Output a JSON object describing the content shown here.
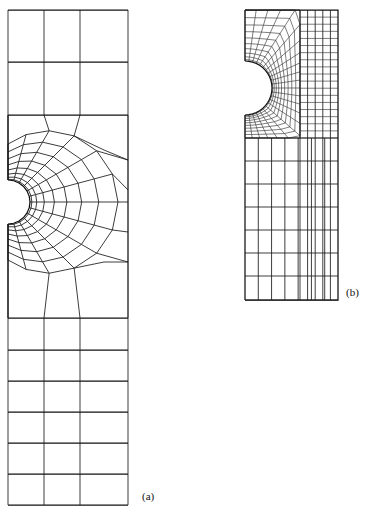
{
  "figure": {
    "type": "finite-element-mesh-comparison",
    "background_color": "#ffffff",
    "line_color": "#1a1a1a",
    "panels": [
      {
        "id": "a",
        "label": "(a)",
        "label_x": 142,
        "label_y": 500,
        "description": "coarse graded finite element mesh of a rectangular strip with a semicircular edge notch",
        "plate": {
          "x": 8,
          "y": 10,
          "width": 120,
          "height": 495
        },
        "notch": {
          "center_x": 8,
          "center_y": 202,
          "radius": 22,
          "side": "left",
          "shape": "semicircle"
        },
        "mesh": {
          "style": "radial-graded",
          "radial_rings": 8,
          "angular_divisions": 12,
          "far_field_columns": 3,
          "far_field_rows_top": 2,
          "far_field_rows_bottom": 6
        }
      },
      {
        "id": "b",
        "label": "(b)",
        "label_x": 346,
        "label_y": 296,
        "description": "fine structured finite element mesh of a rectangular strip with a semicircular edge notch",
        "plate": {
          "x": 245,
          "y": 10,
          "width": 93,
          "height": 290
        },
        "notch": {
          "center_x": 245,
          "center_y": 88,
          "radius": 27,
          "side": "left",
          "shape": "semicircle"
        },
        "mesh": {
          "style": "structured-fine",
          "radial_rings": 10,
          "angular_divisions": 22,
          "far_field_columns": 7,
          "far_field_rows_top": 1,
          "far_field_rows_bottom": 7
        }
      }
    ]
  }
}
